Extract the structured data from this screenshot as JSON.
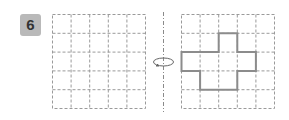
{
  "problem": {
    "number": "6",
    "badge_color": "#b9b9b9",
    "instruction_icon": "rotate-around-axis-icon"
  },
  "left_grid": {
    "cols": 5,
    "rows": 5,
    "filled_cells": []
  },
  "right_grid": {
    "cols": 5,
    "rows": 5,
    "shape_cells": [
      [
        1,
        2
      ],
      [
        2,
        0
      ],
      [
        2,
        1
      ],
      [
        2,
        2
      ],
      [
        2,
        3
      ],
      [
        3,
        1
      ],
      [
        3,
        2
      ]
    ]
  },
  "colors": {
    "grid_line": "#9a9a9a",
    "shape_outline": "#8c8c8c"
  }
}
